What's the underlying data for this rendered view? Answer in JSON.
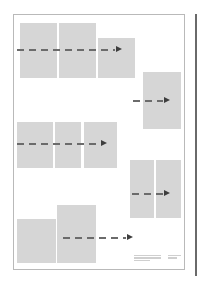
{
  "diagram": {
    "type": "storyboard-layout",
    "colors": {
      "frame_border": "#b9b9b9",
      "panel_fill": "#d6d6d6",
      "arrow_dash": "#6b6b6b",
      "arrow_head": "#3e3e3e",
      "edge_line": "#6a6a6a"
    },
    "rows": [
      {
        "id": "row-1",
        "panels": [
          {
            "x": 20,
            "y": 23,
            "w": 37,
            "h": 55
          },
          {
            "x": 59,
            "y": 23,
            "w": 37,
            "h": 55
          },
          {
            "x": 98,
            "y": 38,
            "w": 37,
            "h": 40
          }
        ],
        "arrow": {
          "x": 17,
          "y": 46,
          "w": 105
        }
      },
      {
        "id": "row-2",
        "panels": [
          {
            "x": 143,
            "y": 72,
            "w": 38,
            "h": 57
          }
        ],
        "arrow": {
          "x": 133,
          "y": 97,
          "w": 37
        }
      },
      {
        "id": "row-3",
        "panels": [
          {
            "x": 17,
            "y": 122,
            "w": 36,
            "h": 46
          },
          {
            "x": 55,
            "y": 122,
            "w": 26,
            "h": 46
          },
          {
            "x": 84,
            "y": 122,
            "w": 33,
            "h": 46
          }
        ],
        "arrow": {
          "x": 17,
          "y": 140,
          "w": 90
        }
      },
      {
        "id": "row-4",
        "panels": [
          {
            "x": 130,
            "y": 160,
            "w": 24,
            "h": 58
          },
          {
            "x": 156,
            "y": 160,
            "w": 25,
            "h": 58
          }
        ],
        "arrow": {
          "x": 132,
          "y": 190,
          "w": 38
        }
      },
      {
        "id": "row-5",
        "panels": [
          {
            "x": 17,
            "y": 219,
            "w": 39,
            "h": 44
          },
          {
            "x": 57,
            "y": 205,
            "w": 39,
            "h": 58
          }
        ],
        "arrow": {
          "x": 63,
          "y": 234,
          "w": 70
        }
      }
    ],
    "caption": {
      "left_lines": [
        "",
        "",
        ""
      ],
      "right_lines": [
        "",
        ""
      ]
    }
  }
}
